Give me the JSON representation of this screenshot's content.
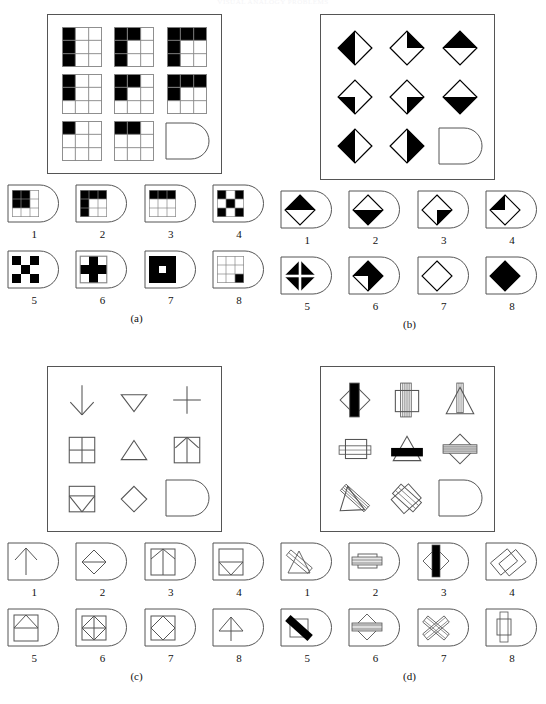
{
  "header": {
    "faint_title": "VISUAL ANALOGY PROBLEMS"
  },
  "colors": {
    "ink": "#111111",
    "stroke": "#555555",
    "fill_black": "#000000",
    "paper": "#ffffff"
  },
  "panels": [
    {
      "id": "a",
      "label": "(a)",
      "matrix_type": "3x3-grid-shading",
      "matrix": [
        {
          "name": "cell-r1c1",
          "desc": "3x3 grid, entire left column black"
        },
        {
          "name": "cell-r1c2",
          "desc": "3x3 grid, left column black plus top-middle black"
        },
        {
          "name": "cell-r1c3",
          "desc": "3x3 grid, left column black plus entire top row black"
        },
        {
          "name": "cell-r2c1",
          "desc": "3x3 grid, top-left and middle-left black"
        },
        {
          "name": "cell-r2c2",
          "desc": "3x3 grid, top-left, top-middle and middle-left black"
        },
        {
          "name": "cell-r2c3",
          "desc": "3x3 grid, whole top row black plus middle-left black"
        },
        {
          "name": "cell-r3c1",
          "desc": "3x3 grid, only top-left black"
        },
        {
          "name": "cell-r3c2",
          "desc": "3x3 grid, top-left and top-middle black"
        },
        {
          "name": "cell-r3c3",
          "desc": "empty answer slot (D-shape)"
        }
      ],
      "options": [
        {
          "num": "1",
          "desc": "3x3 grid with top-left 2x2 block black"
        },
        {
          "num": "2",
          "desc": "3x3 grid with top row and left column black"
        },
        {
          "num": "3",
          "desc": "3x3 grid with entire top row black"
        },
        {
          "num": "4",
          "desc": "3x3 grid checkerboard corners black"
        },
        {
          "num": "5",
          "desc": "3x3 grid checkerboard alternating black"
        },
        {
          "num": "6",
          "desc": "3x3 grid with black plus/cross"
        },
        {
          "num": "7",
          "desc": "solid black square with white centre square"
        },
        {
          "num": "8",
          "desc": "3x3 grid with bottom-right cell black"
        }
      ]
    },
    {
      "id": "b",
      "label": "(b)",
      "matrix_type": "diamond-shading",
      "matrix": [
        {
          "name": "cell-r1c1",
          "desc": "diamond with left half black"
        },
        {
          "name": "cell-r1c2",
          "desc": "diamond with right-upper quadrant black"
        },
        {
          "name": "cell-r1c3",
          "desc": "diamond with top half black"
        },
        {
          "name": "cell-r2c1",
          "desc": "diamond with bottom-left quadrant black"
        },
        {
          "name": "cell-r2c2",
          "desc": "diamond with bottom-right quadrant black"
        },
        {
          "name": "cell-r2c3",
          "desc": "diamond with bottom half black"
        },
        {
          "name": "cell-r3c1",
          "desc": "diamond with left half black"
        },
        {
          "name": "cell-r3c2",
          "desc": "diamond with right half black"
        },
        {
          "name": "cell-r3c3",
          "desc": "empty answer slot (D-shape)"
        }
      ],
      "options": [
        {
          "num": "1",
          "desc": "diamond with top half black"
        },
        {
          "num": "2",
          "desc": "diamond with bottom half black"
        },
        {
          "num": "3",
          "desc": "diamond with bottom-right quadrant black"
        },
        {
          "num": "4",
          "desc": "diamond with top-left quadrant black"
        },
        {
          "num": "5",
          "desc": "diamond black with white cross through centre"
        },
        {
          "num": "6",
          "desc": "diamond with two opposite quadrants black"
        },
        {
          "num": "7",
          "desc": "empty white diamond outline"
        },
        {
          "num": "8",
          "desc": "solid black diamond"
        }
      ]
    },
    {
      "id": "c",
      "label": "(c)",
      "matrix_type": "line-figure",
      "matrix": [
        {
          "name": "cell-r1c1",
          "desc": "downward arrow"
        },
        {
          "name": "cell-r1c2",
          "desc": "downward pointing triangle"
        },
        {
          "name": "cell-r1c3",
          "desc": "plus sign / cross"
        },
        {
          "name": "cell-r2c1",
          "desc": "square divided into four quadrants"
        },
        {
          "name": "cell-r2c2",
          "desc": "upward pointing triangle"
        },
        {
          "name": "cell-r2c3",
          "desc": "square containing upward arrow"
        },
        {
          "name": "cell-r3c1",
          "desc": "square containing downward triangle"
        },
        {
          "name": "cell-r3c2",
          "desc": "diamond outline"
        },
        {
          "name": "cell-r3c3",
          "desc": "empty answer slot (D-shape)"
        }
      ],
      "options": [
        {
          "num": "1",
          "desc": "upward arrow"
        },
        {
          "num": "2",
          "desc": "diamond with horizontal line through centre"
        },
        {
          "num": "3",
          "desc": "square with upward arrow and diagonals"
        },
        {
          "num": "4",
          "desc": "square with downward triangle in lower half"
        },
        {
          "num": "5",
          "desc": "square with upward triangle in upper half"
        },
        {
          "num": "6",
          "desc": "square with inscribed diamond plus cross"
        },
        {
          "num": "7",
          "desc": "square with inscribed diamond"
        },
        {
          "num": "8",
          "desc": "upward arrow with triangular head"
        }
      ]
    },
    {
      "id": "d",
      "label": "(d)",
      "matrix_type": "overlapping-figures",
      "matrix": [
        {
          "name": "cell-r1c1",
          "desc": "diamond overlapped by vertical black bar"
        },
        {
          "name": "cell-r1c2",
          "desc": "square overlapped by vertical striped bar"
        },
        {
          "name": "cell-r1c3",
          "desc": "triangle overlapped by narrow vertical bar"
        },
        {
          "name": "cell-r2c1",
          "desc": "square overlapped by horizontal bar"
        },
        {
          "name": "cell-r2c2",
          "desc": "triangle overlapped by horizontal black bar"
        },
        {
          "num": "",
          "name": "cell-r2c3",
          "desc": "diamond overlapped by horizontal striped bar"
        },
        {
          "name": "cell-r3c1",
          "desc": "triangle overlapped by diagonal striped bar"
        },
        {
          "name": "cell-r3c2",
          "desc": "two overlapping tilted squares"
        },
        {
          "name": "cell-r3c3",
          "desc": "empty answer slot (D-shape)"
        }
      ],
      "options": [
        {
          "num": "1",
          "desc": "tilted square with diagonal bar"
        },
        {
          "num": "2",
          "desc": "square with horizontal striped bar"
        },
        {
          "num": "3",
          "desc": "diamond with vertical black bar"
        },
        {
          "num": "4",
          "desc": "two overlapping tilted squares"
        },
        {
          "num": "5",
          "desc": "square with thick black diagonal bar"
        },
        {
          "num": "6",
          "desc": "diamond with horizontal striped bar"
        },
        {
          "num": "7",
          "desc": "two crossed striped bars"
        },
        {
          "num": "8",
          "desc": "square with vertical bar"
        }
      ]
    }
  ]
}
